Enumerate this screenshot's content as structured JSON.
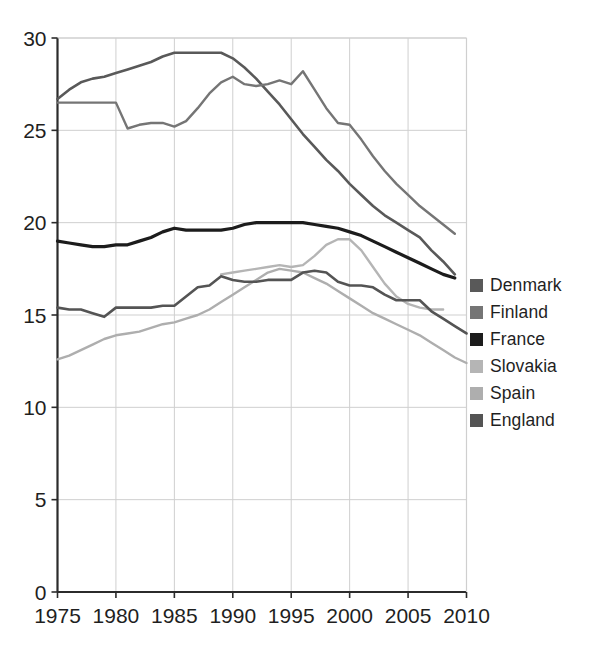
{
  "chart_data": {
    "type": "line",
    "title": "",
    "xlabel": "",
    "ylabel": "",
    "xlim": [
      1975,
      2010
    ],
    "ylim": [
      0,
      30
    ],
    "grid": true,
    "legend_position": "right",
    "x_ticks": [
      "1975",
      "1980",
      "1985",
      "1990",
      "1995",
      "2000",
      "2005",
      "2010"
    ],
    "y_ticks": [
      "0",
      "5",
      "10",
      "15",
      "20",
      "25",
      "30"
    ],
    "x": [
      1975,
      1976,
      1977,
      1978,
      1979,
      1980,
      1981,
      1982,
      1983,
      1984,
      1985,
      1986,
      1987,
      1988,
      1989,
      1990,
      1991,
      1992,
      1993,
      1994,
      1995,
      1996,
      1997,
      1998,
      1999,
      2000,
      2001,
      2002,
      2003,
      2004,
      2005,
      2006,
      2007,
      2008,
      2009,
      2010
    ],
    "series": [
      {
        "name": "Denmark",
        "color": "#595959",
        "width": 2.6,
        "values": [
          26.7,
          27.2,
          27.6,
          27.8,
          27.9,
          28.1,
          28.3,
          28.5,
          28.7,
          29.0,
          29.2,
          29.2,
          29.2,
          29.2,
          29.2,
          28.9,
          28.4,
          27.8,
          27.1,
          26.4,
          25.6,
          24.8,
          24.1,
          23.4,
          22.8,
          22.1,
          21.5,
          20.9,
          20.4,
          20.0,
          19.6,
          19.2,
          18.5,
          17.9,
          17.2,
          null
        ]
      },
      {
        "name": "Finland",
        "color": "#757575",
        "width": 2.4,
        "values": [
          26.5,
          26.5,
          26.5,
          26.5,
          26.5,
          26.5,
          25.1,
          25.3,
          25.4,
          25.4,
          25.2,
          25.5,
          26.2,
          27.0,
          27.6,
          27.9,
          27.5,
          27.4,
          27.5,
          27.7,
          27.5,
          28.2,
          27.2,
          26.2,
          25.4,
          25.3,
          24.5,
          23.6,
          22.8,
          22.1,
          21.5,
          20.9,
          20.4,
          19.9,
          19.4,
          null
        ]
      },
      {
        "name": "France",
        "color": "#1c1c1c",
        "width": 3.2,
        "values": [
          19.0,
          18.9,
          18.8,
          18.7,
          18.7,
          18.8,
          18.8,
          19.0,
          19.2,
          19.5,
          19.7,
          19.6,
          19.6,
          19.6,
          19.6,
          19.7,
          19.9,
          20.0,
          20.0,
          20.0,
          20.0,
          20.0,
          19.9,
          19.8,
          19.7,
          19.5,
          19.3,
          19.0,
          18.7,
          18.4,
          18.1,
          17.8,
          17.5,
          17.2,
          17.0,
          null
        ]
      },
      {
        "name": "Slovakia",
        "color": "#b5b5b5",
        "width": 2.4,
        "values": [
          null,
          null,
          null,
          null,
          null,
          null,
          null,
          null,
          null,
          null,
          null,
          null,
          null,
          null,
          17.2,
          17.3,
          17.4,
          17.5,
          17.6,
          17.7,
          17.6,
          17.7,
          18.2,
          18.8,
          19.1,
          19.1,
          18.5,
          17.6,
          16.7,
          16.0,
          15.6,
          15.4,
          15.3,
          15.3,
          null,
          null
        ]
      },
      {
        "name": "Spain",
        "color": "#aeaeae",
        "width": 2.4,
        "values": [
          12.6,
          12.8,
          13.1,
          13.4,
          13.7,
          13.9,
          14.0,
          14.1,
          14.3,
          14.5,
          14.6,
          14.8,
          15.0,
          15.3,
          15.7,
          16.1,
          16.5,
          16.9,
          17.3,
          17.5,
          17.4,
          17.3,
          17.0,
          16.7,
          16.3,
          15.9,
          15.5,
          15.1,
          14.8,
          14.5,
          14.2,
          13.9,
          13.5,
          13.1,
          12.7,
          12.4
        ]
      },
      {
        "name": "England",
        "color": "#545454",
        "width": 2.6,
        "values": [
          15.4,
          15.3,
          15.3,
          15.1,
          14.9,
          15.4,
          15.4,
          15.4,
          15.4,
          15.5,
          15.5,
          16.0,
          16.5,
          16.6,
          17.1,
          16.9,
          16.8,
          16.8,
          16.9,
          16.9,
          16.9,
          17.3,
          17.4,
          17.3,
          16.8,
          16.6,
          16.6,
          16.5,
          16.1,
          15.8,
          15.8,
          15.8,
          15.2,
          14.8,
          14.4,
          14.0
        ]
      }
    ]
  },
  "legend": {
    "items": [
      {
        "label": "Denmark",
        "color": "#595959"
      },
      {
        "label": "Finland",
        "color": "#757575"
      },
      {
        "label": "France",
        "color": "#1c1c1c"
      },
      {
        "label": "Slovakia",
        "color": "#b5b5b5"
      },
      {
        "label": "Spain",
        "color": "#aeaeae"
      },
      {
        "label": "England",
        "color": "#545454"
      }
    ]
  },
  "axes": {
    "axis_color": "#2b2b2b",
    "grid_color": "#cfcfcf",
    "tick_label_color": "#1f1f1f"
  }
}
